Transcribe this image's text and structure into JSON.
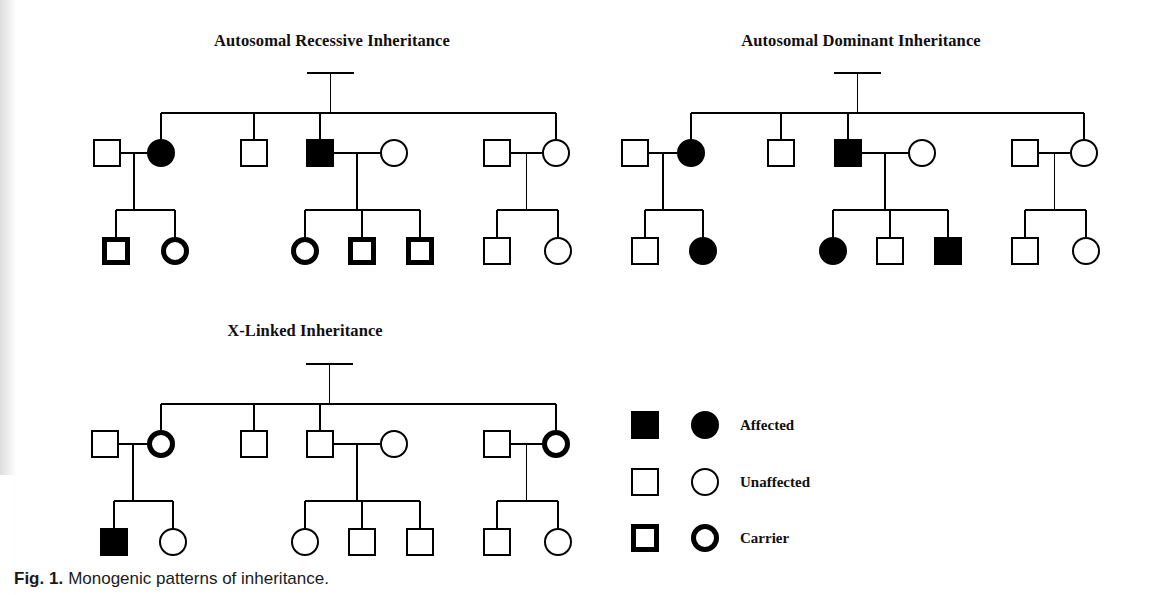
{
  "figure": {
    "caption_figno": "Fig. 1.",
    "caption_text": "Monogenic patterns of inheritance.",
    "ink_color": "#000000",
    "background_color": "#ffffff"
  },
  "symbol_styles": {
    "affected": {
      "name": "affected",
      "fill": "#000000",
      "stroke": "#000000",
      "stroke_width": 2
    },
    "unaffected": {
      "name": "unaffected",
      "fill": "#ffffff",
      "stroke": "#000000",
      "stroke_width": 2
    },
    "carrier": {
      "name": "carrier",
      "fill": "#ffffff",
      "stroke": "#000000",
      "stroke_width": 5
    }
  },
  "legend": {
    "name": "legend",
    "rows": [
      {
        "status": "affected",
        "label": "Affected"
      },
      {
        "status": "unaffected",
        "label": "Unaffected"
      },
      {
        "status": "carrier",
        "label": "Carrier"
      }
    ]
  },
  "pedigrees": [
    {
      "id": "autosomal-recessive",
      "title": "Autosomal Recessive Inheritance",
      "title_x": 332,
      "title_y": 46,
      "founders": {
        "father": {
          "sex": "male",
          "status": "carrier",
          "x": 293,
          "y": 73
        },
        "mother": {
          "sex": "female",
          "status": "unaffected",
          "x": 368,
          "y": 73
        }
      },
      "sibship_y": 113,
      "children": [
        {
          "sex": "female",
          "status": "affected",
          "x": 161,
          "y": 153,
          "spouse": {
            "sex": "male",
            "status": "unaffected",
            "x": 107,
            "y": 153
          },
          "grandchildren_y": 251,
          "grandchild_bar_y": 210,
          "grandchildren": [
            {
              "sex": "male",
              "status": "carrier",
              "x": 116,
              "y": 251
            },
            {
              "sex": "female",
              "status": "carrier",
              "x": 175,
              "y": 251
            }
          ]
        },
        {
          "sex": "male",
          "status": "unaffected",
          "x": 254,
          "y": 153,
          "spouse": null,
          "grandchildren": []
        },
        {
          "sex": "male",
          "status": "affected",
          "x": 320,
          "y": 153,
          "spouse": {
            "sex": "female",
            "status": "unaffected",
            "x": 394,
            "y": 153
          },
          "grandchildren_y": 251,
          "grandchild_bar_y": 210,
          "grandchildren": [
            {
              "sex": "female",
              "status": "carrier",
              "x": 305,
              "y": 251
            },
            {
              "sex": "male",
              "status": "carrier",
              "x": 362,
              "y": 251
            },
            {
              "sex": "male",
              "status": "carrier",
              "x": 420,
              "y": 251
            }
          ]
        },
        {
          "sex": "female",
          "status": "unaffected",
          "x": 556,
          "y": 153,
          "spouse": {
            "sex": "male",
            "status": "unaffected",
            "x": 497,
            "y": 153
          },
          "grandchildren_y": 251,
          "grandchild_bar_y": 210,
          "grandchildren": [
            {
              "sex": "male",
              "status": "unaffected",
              "x": 497,
              "y": 251
            },
            {
              "sex": "female",
              "status": "unaffected",
              "x": 558,
              "y": 251
            }
          ]
        }
      ]
    },
    {
      "id": "autosomal-dominant",
      "title": "Autosomal Dominant Inheritance",
      "title_x": 861,
      "title_y": 46,
      "founders": {
        "father": {
          "sex": "male",
          "status": "affected",
          "x": 820,
          "y": 73
        },
        "mother": {
          "sex": "female",
          "status": "unaffected",
          "x": 895,
          "y": 73
        }
      },
      "sibship_y": 113,
      "children": [
        {
          "sex": "female",
          "status": "affected",
          "x": 691,
          "y": 153,
          "spouse": {
            "sex": "male",
            "status": "unaffected",
            "x": 635,
            "y": 153
          },
          "grandchildren_y": 251,
          "grandchild_bar_y": 210,
          "grandchildren": [
            {
              "sex": "male",
              "status": "unaffected",
              "x": 645,
              "y": 251
            },
            {
              "sex": "female",
              "status": "affected",
              "x": 703,
              "y": 251
            }
          ]
        },
        {
          "sex": "male",
          "status": "unaffected",
          "x": 781,
          "y": 153,
          "spouse": null,
          "grandchildren": []
        },
        {
          "sex": "male",
          "status": "affected",
          "x": 848,
          "y": 153,
          "spouse": {
            "sex": "female",
            "status": "unaffected",
            "x": 922,
            "y": 153
          },
          "grandchildren_y": 251,
          "grandchild_bar_y": 210,
          "grandchildren": [
            {
              "sex": "female",
              "status": "affected",
              "x": 833,
              "y": 251
            },
            {
              "sex": "male",
              "status": "unaffected",
              "x": 890,
              "y": 251
            },
            {
              "sex": "male",
              "status": "affected",
              "x": 948,
              "y": 251
            }
          ]
        },
        {
          "sex": "female",
          "status": "unaffected",
          "x": 1084,
          "y": 153,
          "spouse": {
            "sex": "male",
            "status": "unaffected",
            "x": 1025,
            "y": 153
          },
          "grandchildren_y": 251,
          "grandchild_bar_y": 210,
          "grandchildren": [
            {
              "sex": "male",
              "status": "unaffected",
              "x": 1025,
              "y": 251
            },
            {
              "sex": "female",
              "status": "unaffected",
              "x": 1086,
              "y": 251
            }
          ]
        }
      ]
    },
    {
      "id": "x-linked",
      "title": "X-Linked Inheritance",
      "title_x": 305,
      "title_y": 336,
      "founders": {
        "father": {
          "sex": "male",
          "status": "affected",
          "x": 292,
          "y": 364
        },
        "mother": {
          "sex": "female",
          "status": "unaffected",
          "x": 367,
          "y": 364
        }
      },
      "sibship_y": 404,
      "children": [
        {
          "sex": "female",
          "status": "carrier",
          "x": 161,
          "y": 444,
          "spouse": {
            "sex": "male",
            "status": "unaffected",
            "x": 105,
            "y": 444
          },
          "grandchildren_y": 542,
          "grandchild_bar_y": 501,
          "grandchildren": [
            {
              "sex": "male",
              "status": "affected",
              "x": 114,
              "y": 542
            },
            {
              "sex": "female",
              "status": "unaffected",
              "x": 173,
              "y": 542
            }
          ]
        },
        {
          "sex": "male",
          "status": "unaffected",
          "x": 254,
          "y": 444,
          "spouse": null,
          "grandchildren": []
        },
        {
          "sex": "male",
          "status": "unaffected",
          "x": 320,
          "y": 444,
          "spouse": {
            "sex": "female",
            "status": "unaffected",
            "x": 394,
            "y": 444
          },
          "grandchildren_y": 542,
          "grandchild_bar_y": 501,
          "grandchildren": [
            {
              "sex": "female",
              "status": "unaffected",
              "x": 305,
              "y": 542
            },
            {
              "sex": "male",
              "status": "unaffected",
              "x": 362,
              "y": 542
            },
            {
              "sex": "male",
              "status": "unaffected",
              "x": 420,
              "y": 542
            }
          ]
        },
        {
          "sex": "female",
          "status": "carrier",
          "x": 556,
          "y": 444,
          "spouse": {
            "sex": "male",
            "status": "unaffected",
            "x": 497,
            "y": 444
          },
          "grandchildren_y": 542,
          "grandchild_bar_y": 501,
          "grandchildren": [
            {
              "sex": "male",
              "status": "unaffected",
              "x": 497,
              "y": 542
            },
            {
              "sex": "female",
              "status": "unaffected",
              "x": 558,
              "y": 542
            }
          ]
        }
      ]
    }
  ],
  "legend_layout": {
    "square_x": 645,
    "circle_x": 705,
    "label_x": 740,
    "rows_y": [
      425,
      482,
      538
    ]
  }
}
